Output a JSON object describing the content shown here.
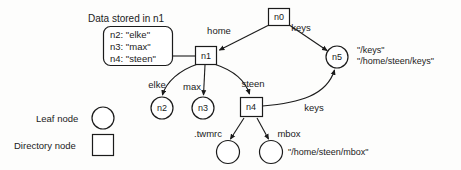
{
  "figure": {
    "caption": "Data stored in n1",
    "data_box": {
      "lines": [
        "n2: \"elke\"",
        "n3: \"max\"",
        "n4: \"steen\""
      ]
    },
    "nodes": [
      {
        "id": "n0",
        "label": "n0",
        "shape": "square",
        "cx": 279,
        "cy": 17
      },
      {
        "id": "n1",
        "label": "n1",
        "shape": "square",
        "cx": 206,
        "cy": 56
      },
      {
        "id": "n2",
        "label": "n2",
        "shape": "circle",
        "cx": 162,
        "cy": 108
      },
      {
        "id": "n3",
        "label": "n3",
        "shape": "circle",
        "cx": 203,
        "cy": 108
      },
      {
        "id": "n4",
        "label": "n4",
        "shape": "square",
        "cx": 251,
        "cy": 107
      },
      {
        "id": "n5",
        "label": "n5",
        "shape": "circle",
        "cx": 337,
        "cy": 57
      },
      {
        "id": "leaf-twmrc",
        "label": "",
        "shape": "circle",
        "cx": 228,
        "cy": 152
      },
      {
        "id": "leaf-mbox",
        "label": "",
        "shape": "circle",
        "cx": 271,
        "cy": 152
      }
    ],
    "edges": [
      {
        "from": "n0",
        "to": "n1",
        "label": "home"
      },
      {
        "from": "n0",
        "to": "n5",
        "label": "keys"
      },
      {
        "from": "n1",
        "to": "n2",
        "label": "elke"
      },
      {
        "from": "n1",
        "to": "n3",
        "label": "max"
      },
      {
        "from": "n1",
        "to": "n4",
        "label": "steen"
      },
      {
        "from": "n4",
        "to": "leaf-twmrc",
        "label": ".twmrc"
      },
      {
        "from": "n4",
        "to": "leaf-mbox",
        "label": "mbox"
      },
      {
        "from": "n4",
        "to": "n5",
        "label": "keys"
      }
    ],
    "annotations": {
      "keys_paths": {
        "line1": "\"/keys\"",
        "line2": "\"/home/steen/keys\""
      },
      "mbox_path": "\"/home/steen/mbox\""
    },
    "legend": [
      {
        "label": "Leaf node",
        "shape": "circle"
      },
      {
        "label": "Directory node",
        "shape": "square"
      }
    ],
    "colors": {
      "stroke": "#1b1b1b",
      "fill": "#ffffff",
      "background": "#fdfdfc"
    }
  }
}
